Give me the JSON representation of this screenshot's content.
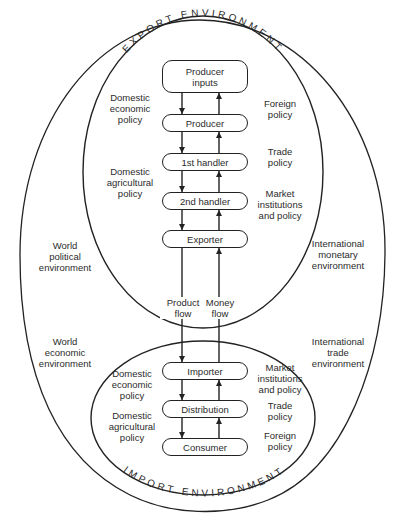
{
  "environments": {
    "export": {
      "title": "EXPORT ENVIRONMENT"
    },
    "import": {
      "title": "IMPORT ENVIRONMENT"
    }
  },
  "export_chain": [
    {
      "label": "Producer\ninputs"
    },
    {
      "label": "Producer"
    },
    {
      "label": "1st handler"
    },
    {
      "label": "2nd handler"
    },
    {
      "label": "Exporter"
    }
  ],
  "import_chain": [
    {
      "label": "Importer"
    },
    {
      "label": "Distribution"
    },
    {
      "label": "Consumer"
    }
  ],
  "export_left_labels": [
    {
      "text": "Domestic\neconomic\npolicy"
    },
    {
      "text": "Domestic\nagricultural\npolicy"
    }
  ],
  "export_right_labels": [
    {
      "text": "Foreign\npolicy"
    },
    {
      "text": "Trade\npolicy"
    },
    {
      "text": "Market\ninstitutions\nand policy"
    }
  ],
  "import_left_labels": [
    {
      "text": "Domestic\neconomic\npolicy"
    },
    {
      "text": "Domestic\nagricultural\npolicy"
    }
  ],
  "import_right_labels": [
    {
      "text": "Market\ninstitutions\nand policy"
    },
    {
      "text": "Trade\npolicy"
    },
    {
      "text": "Foreign\npolicy"
    }
  ],
  "flows": {
    "product": "Product\nflow",
    "money": "Money\nflow"
  },
  "world_labels": {
    "political": "World\npolitical\nenvironment",
    "economic": "World\neconomic\nenvironment",
    "monetary": "International\nmonetary\nenvironment",
    "trade": "International\ntrade\nenvironment"
  },
  "colors": {
    "line": "#222222",
    "text": "#2b2b2b",
    "background": "#ffffff"
  }
}
